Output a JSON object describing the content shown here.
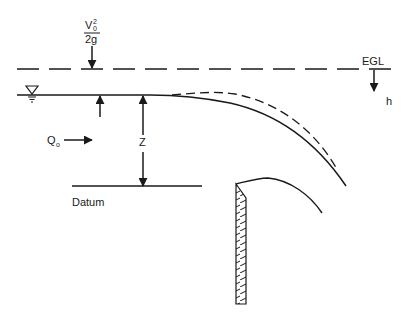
{
  "diagram": {
    "type": "sharp-crested weir flow profile",
    "labels": {
      "velocity_head_numerator": "V",
      "velocity_head_sup": "2",
      "velocity_head_sub": "0",
      "velocity_head_denominator": "2g",
      "egl": "EGL",
      "head": "h",
      "elevation": "Z",
      "discharge": "Q",
      "discharge_sub": "o",
      "datum": "Datum"
    },
    "colors": {
      "stroke": "#1a1a1a",
      "background": "#ffffff"
    },
    "elements": [
      "energy-grade-line (dashed)",
      "free water surface with drawdown",
      "upper nappe (dashed)",
      "lower nappe",
      "sharp-crested weir plate (hatched)",
      "datum line",
      "water-level symbol"
    ]
  }
}
